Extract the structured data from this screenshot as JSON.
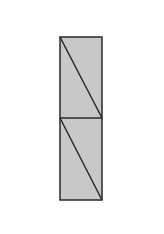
{
  "diagram": {
    "colors": {
      "background": "#ffffff",
      "fill": "#c8c8c8",
      "stroke": "#2a2a2a"
    },
    "rect": {
      "x": 60,
      "y": 37,
      "width": 42,
      "height": 163
    },
    "divider_y": 118,
    "segments": [
      {
        "name": "upper-half",
        "x1": 60,
        "y1": 37,
        "x2": 102,
        "y2": 118
      },
      {
        "name": "lower-half",
        "x1": 60,
        "y1": 118,
        "x2": 102,
        "y2": 200
      }
    ]
  }
}
